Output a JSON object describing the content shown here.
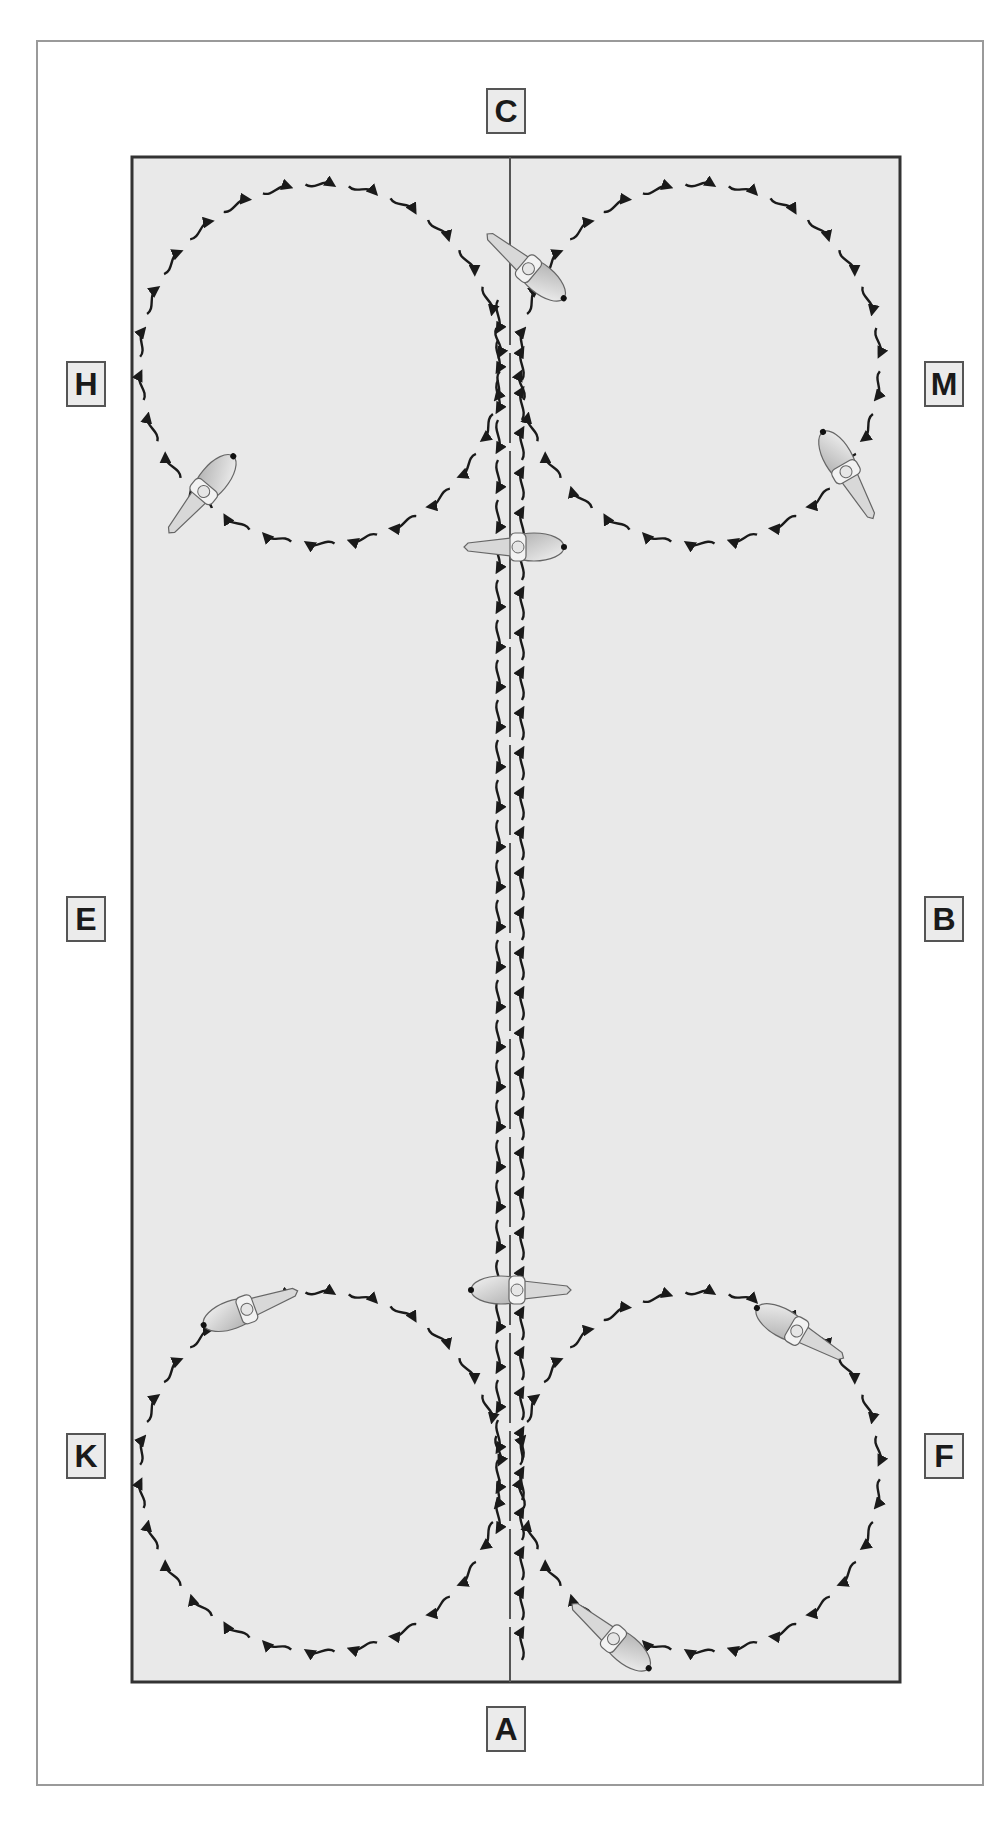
{
  "figure": {
    "arena": {
      "fill_color": "#e9e9e9",
      "border_color": "#333333",
      "centerline_color": "#555555",
      "track_color": "#1a1a1a",
      "x": 132,
      "y": 157,
      "width": 768,
      "height": 1525
    },
    "markers": [
      {
        "letter": "C",
        "position": "top-center",
        "x": 486,
        "y": 88
      },
      {
        "letter": "H",
        "position": "left-upper",
        "x": 66,
        "y": 361
      },
      {
        "letter": "M",
        "position": "right-upper",
        "x": 924,
        "y": 361
      },
      {
        "letter": "E",
        "position": "left-middle",
        "x": 66,
        "y": 896
      },
      {
        "letter": "B",
        "position": "right-middle",
        "x": 924,
        "y": 896
      },
      {
        "letter": "K",
        "position": "left-lower",
        "x": 66,
        "y": 1433
      },
      {
        "letter": "F",
        "position": "right-lower",
        "x": 924,
        "y": 1433
      },
      {
        "letter": "A",
        "position": "bottom-center",
        "x": 486,
        "y": 1706
      }
    ],
    "circles": [
      {
        "name": "circle-top-left",
        "cx": 320,
        "cy": 364,
        "r": 180,
        "direction": "clockwise"
      },
      {
        "name": "circle-top-right",
        "cx": 700,
        "cy": 364,
        "r": 180,
        "direction": "clockwise"
      },
      {
        "name": "circle-bottom-left",
        "cx": 320,
        "cy": 1472,
        "r": 180,
        "direction": "clockwise"
      },
      {
        "name": "circle-bottom-right",
        "cx": 700,
        "cy": 1472,
        "r": 180,
        "direction": "clockwise"
      }
    ],
    "centerline_tracks": [
      {
        "name": "track-left-down",
        "x": 498,
        "y1": 300,
        "y2": 1540,
        "direction": "down"
      },
      {
        "name": "track-right-up",
        "x": 522,
        "y1": 1660,
        "y2": 320,
        "direction": "up"
      }
    ],
    "horses": [
      {
        "name": "horse-top-center-up",
        "x": 530,
        "y": 270,
        "angle": -140
      },
      {
        "name": "horse-top-left-circle",
        "x": 205,
        "y": 490,
        "angle": 130
      },
      {
        "name": "horse-top-centre-crossing",
        "x": 520,
        "y": 547,
        "angle": 180
      },
      {
        "name": "horse-top-right-circle",
        "x": 845,
        "y": 470,
        "angle": 60
      },
      {
        "name": "horse-bottom-centre-crossing",
        "x": 515,
        "y": 1290,
        "angle": 0
      },
      {
        "name": "horse-bottom-left-circle",
        "x": 245,
        "y": 1310,
        "angle": -20
      },
      {
        "name": "horse-bottom-right-circle",
        "x": 795,
        "y": 1330,
        "angle": 30
      },
      {
        "name": "horse-bottom-right-lower",
        "x": 615,
        "y": 1640,
        "angle": -140
      }
    ]
  }
}
